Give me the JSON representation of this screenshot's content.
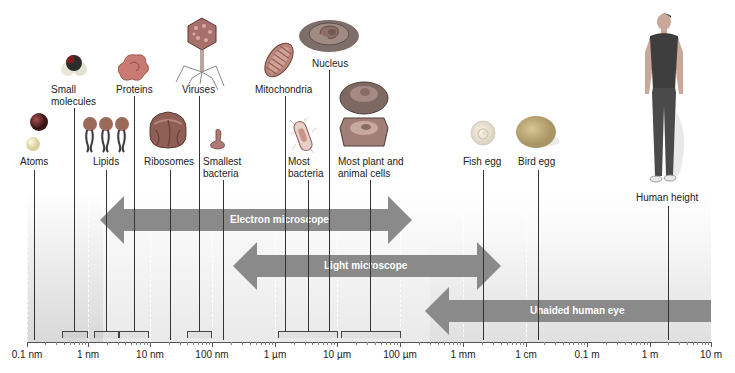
{
  "figure": {
    "scale_ticks": [
      "0.1 nm",
      "1 nm",
      "10 nm",
      "100 nm",
      "1 µm",
      "10 µm",
      "100 µm",
      "1 mm",
      "1 cm",
      "0.1 m",
      "1 m",
      "10 m"
    ],
    "items": {
      "atoms": "Atoms",
      "small_molecules_1": "Small",
      "small_molecules_2": "molecules",
      "lipids": "Lipids",
      "proteins": "Proteins",
      "ribosomes": "Ribosomes",
      "viruses": "Viruses",
      "smallest_bacteria_1": "Smallest",
      "smallest_bacteria_2": "bacteria",
      "mitochondria": "Mitochondria",
      "most_bacteria_1": "Most",
      "most_bacteria_2": "bacteria",
      "nucleus": "Nucleus",
      "cells_1": "Most plant and",
      "cells_2": "animal cells",
      "fish_egg": "Fish egg",
      "bird_egg": "Bird egg",
      "human_height": "Human height"
    },
    "ranges": {
      "electron": "Electron microscope",
      "light": "Light microscope",
      "eye": "Unaided human eye"
    },
    "colors": {
      "arrow": "#8a8a8a",
      "background_top": "#ffffff",
      "background_bottom": "#e6e6e6"
    }
  }
}
